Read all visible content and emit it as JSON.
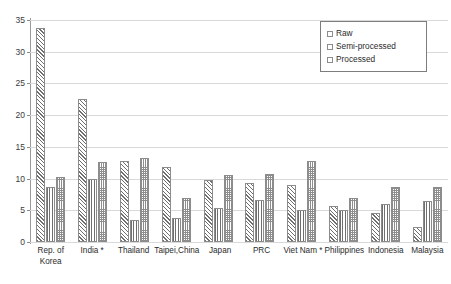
{
  "chart_data": {
    "type": "bar",
    "title": "",
    "subtitle": "",
    "xlabel": "",
    "ylabel": "",
    "ylim": [
      0,
      35
    ],
    "ytick_step": 5,
    "yticks": [
      0,
      5,
      10,
      15,
      20,
      25,
      30,
      35
    ],
    "grid": true,
    "legend_position": "top-right",
    "categories": [
      "Rep. of\nKorea",
      "India *",
      "Thailand",
      "Taipei,China",
      "Japan",
      "PRC",
      "Viet Nam *",
      "Philippines",
      "Indonesia",
      "Malaysia"
    ],
    "series": [
      {
        "name": "Raw",
        "pattern": "diagonal-hatch",
        "values": [
          33.7,
          22.5,
          12.8,
          11.8,
          9.8,
          9.3,
          9.0,
          5.6,
          4.6,
          2.4
        ]
      },
      {
        "name": "Semi-processed",
        "pattern": "vertical-lines",
        "values": [
          8.6,
          10.0,
          3.4,
          3.8,
          5.3,
          6.6,
          5.0,
          5.0,
          6.0,
          6.5
        ]
      },
      {
        "name": "Processed",
        "pattern": "dotted-grid",
        "values": [
          10.2,
          12.6,
          13.3,
          6.9,
          10.5,
          10.8,
          12.8,
          7.0,
          8.6,
          8.7
        ]
      }
    ]
  },
  "legend": {
    "items": [
      {
        "label": "Raw"
      },
      {
        "label": "Semi-processed"
      },
      {
        "label": "Processed"
      }
    ]
  },
  "colors": {
    "grid": "#d9d9d9",
    "axis": "#8a8a8a",
    "bar_outline": "#8c8c8c",
    "text": "#2b2b2b",
    "background": "#ffffff"
  }
}
